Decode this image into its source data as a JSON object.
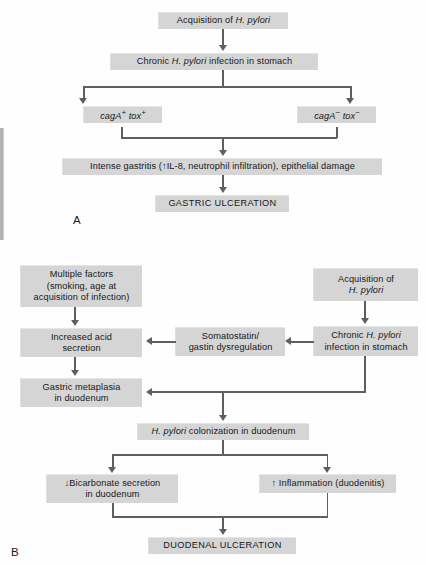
{
  "figure": {
    "panels": [
      {
        "letter": "A",
        "nodes": {
          "acquisition": "Acquisition of H. pylori",
          "chronic_infection": "Chronic H. pylori infection in stomach",
          "cag_pos": "cagA+ tox+",
          "cag_neg": "cagA− tox−",
          "gastritis": "Intense gastritis (↑IL-8, neutrophil infiltration), epithelial damage",
          "outcome": "GASTRIC ULCERATION"
        }
      },
      {
        "letter": "B",
        "nodes": {
          "multiple_factors": "Multiple factors (smoking, age at acquisition of infection)",
          "acquisition": "Acquisition of H. pylori",
          "chronic_infection": "Chronic H. pylori infection in stomach",
          "somatostatin": "Somatostatin/ gastin dysregulation",
          "increased_acid": "Increased acid secretion",
          "gastric_metaplasia": "Gastric metaplasia in duodenum",
          "colonization": "H. pylori colonization in duodenum",
          "bicarbonate": "↓Bicarbonate secretion in duodenum",
          "inflammation": "↑ Inflammation (duodenitis)",
          "outcome": "DUODENAL ULCERATION"
        }
      }
    ],
    "colors": {
      "box_fill": "#d5d5d5",
      "box_shadow": "#9d9d9d",
      "connector": "#5d5f61",
      "text": "#16171a",
      "background": "#ffffff"
    }
  }
}
